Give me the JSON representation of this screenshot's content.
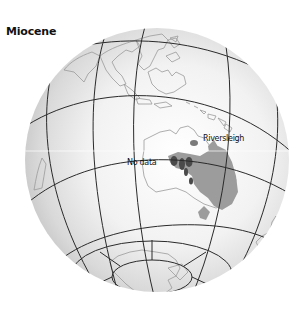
{
  "figure": {
    "title": "Miocene",
    "projection": "orthographic-globe"
  },
  "labels": {
    "no_data": "No data",
    "site": "Riversleigh"
  },
  "colors": {
    "background": "#ffffff",
    "globe_edge": "#c8c8c8",
    "globe_center": "#fafafa",
    "graticule": "#2a2a2a",
    "coastline": "#9a9a9a",
    "region_light": "#9c9c9c",
    "region_dark": "#4a4a4a",
    "text": "#111111"
  },
  "legend_regions": [
    {
      "name": "fossil-region-light",
      "shade": "light gray"
    },
    {
      "name": "fossil-region-dark",
      "shade": "dark gray"
    }
  ]
}
